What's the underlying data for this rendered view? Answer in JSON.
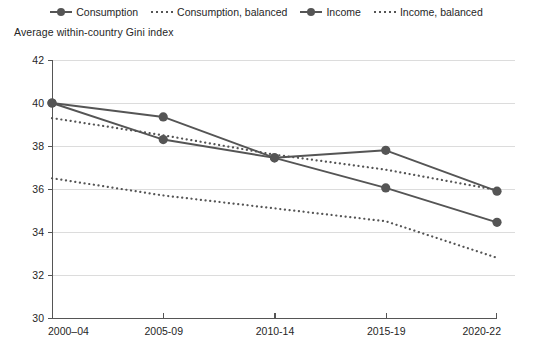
{
  "chart_data": {
    "type": "line",
    "title": "",
    "axis_title": "Average within-country Gini index",
    "xlabel": "",
    "ylabel": "Average within-country Gini index",
    "categories": [
      "2000–04",
      "2005-09",
      "2010-14",
      "2015-19",
      "2020-22"
    ],
    "ylim": [
      30,
      42
    ],
    "yticks": [
      30,
      32,
      34,
      36,
      38,
      40,
      42
    ],
    "grid": true,
    "legend_position": "top-center",
    "series": [
      {
        "name": "Consumption",
        "style": "solid",
        "markers": true,
        "color": "#555555",
        "values": [
          40.0,
          38.3,
          37.45,
          36.05,
          34.45
        ]
      },
      {
        "name": "Consumption, balanced",
        "style": "dotted",
        "markers": false,
        "color": "#555555",
        "values": [
          36.5,
          35.7,
          35.1,
          34.5,
          32.8
        ]
      },
      {
        "name": "Income",
        "style": "solid",
        "markers": true,
        "color": "#555555",
        "values": [
          40.0,
          39.35,
          37.45,
          37.8,
          35.9
        ]
      },
      {
        "name": "Income, balanced",
        "style": "dotted",
        "markers": false,
        "color": "#555555",
        "values": [
          39.3,
          38.5,
          37.6,
          36.9,
          35.95
        ]
      }
    ]
  },
  "legend": {
    "items": [
      {
        "label": "Consumption",
        "style": "solid"
      },
      {
        "label": "Consumption, balanced",
        "style": "dotted"
      },
      {
        "label": "Income",
        "style": "solid"
      },
      {
        "label": "Income, balanced",
        "style": "dotted"
      }
    ]
  },
  "colors": {
    "series": "#555555",
    "grid": "#dcdcdc",
    "axis": "#555555",
    "text": "#262626",
    "background": "#ffffff"
  }
}
